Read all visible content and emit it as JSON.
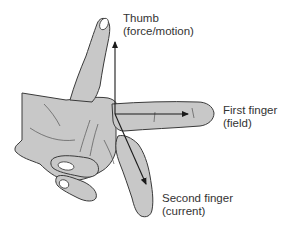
{
  "diagram": {
    "labels": {
      "thumb": {
        "title": "Thumb",
        "subtitle": "(force/motion)"
      },
      "first_finger": {
        "title": "First finger",
        "subtitle": "(field)"
      },
      "second_finger": {
        "title": "Second finger",
        "subtitle": "(current)"
      }
    },
    "arrows": [
      {
        "name": "thumb-arrow",
        "direction": "up"
      },
      {
        "name": "first-finger-arrow",
        "direction": "right"
      },
      {
        "name": "second-finger-arrow",
        "direction": "down-right"
      }
    ],
    "colors": {
      "hand_fill": "#c8c8c8",
      "outline": "#3a3a3a",
      "arrow": "#1a1a1a",
      "text": "#333333",
      "background": "#ffffff"
    }
  }
}
